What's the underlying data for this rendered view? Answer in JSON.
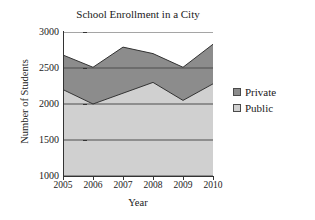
{
  "chart_data": {
    "type": "area",
    "title": "School Enrollment in a City",
    "xlabel": "Year",
    "ylabel": "Number of Students",
    "categories": [
      "2005",
      "2006",
      "2007",
      "2008",
      "2009",
      "2010"
    ],
    "x": [
      2005,
      2006,
      2007,
      2008,
      2009,
      2010
    ],
    "stacked": true,
    "series": [
      {
        "name": "Public",
        "color": "#d0d0d0",
        "values": [
          2200,
          2000,
          2150,
          2300,
          2050,
          2280
        ]
      },
      {
        "name": "Private",
        "color": "#8c8c8c",
        "values": [
          480,
          510,
          640,
          400,
          460,
          550
        ]
      }
    ],
    "cumulative_totals": [
      2680,
      2510,
      2790,
      2700,
      2510,
      2830
    ],
    "ylim": [
      1000,
      3000
    ],
    "y_ticks": [
      1000,
      1500,
      2000,
      2500,
      3000
    ],
    "y_tick_labels": [
      "1000",
      "1500",
      "2000",
      "2500",
      "3000"
    ],
    "grid": true,
    "grid_axis": "y",
    "legend_position": "right"
  },
  "legend": {
    "items": [
      {
        "label": "Private",
        "swatch": "filled-dark-square"
      },
      {
        "label": "Public",
        "swatch": "open-light-square"
      }
    ]
  },
  "colors": {
    "private_fill": "#8c8c8c",
    "public_fill": "#d0d0d0",
    "axis": "#333333",
    "grid": "#4d4d4d",
    "text": "#1a1a1a",
    "plot_background": "#ffffff"
  }
}
